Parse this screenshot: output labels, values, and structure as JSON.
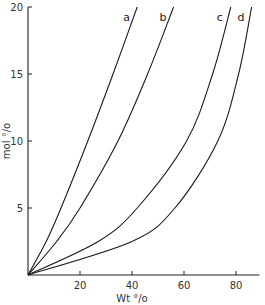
{
  "chart_data": {
    "type": "line",
    "title": "",
    "xlabel": "Wt °/o",
    "ylabel": "mol °/o",
    "xlim": [
      0,
      89
    ],
    "ylim": [
      0,
      20
    ],
    "xticks": [
      20,
      40,
      60,
      80
    ],
    "yticks": [
      5,
      10,
      15,
      20
    ],
    "grid": false,
    "legend": "curve labels at top ends",
    "series": [
      {
        "name": "a",
        "x": [
          0,
          7,
          12.7,
          23,
          32.7,
          42
        ],
        "y": [
          0,
          2.5,
          5,
          10,
          15,
          20
        ]
      },
      {
        "name": "b",
        "x": [
          0,
          11,
          20,
          34.6,
          46,
          56
        ],
        "y": [
          0,
          2.5,
          5,
          10,
          15,
          20
        ]
      },
      {
        "name": "c",
        "x": [
          0,
          27,
          42,
          61,
          71,
          78
        ],
        "y": [
          0,
          2.5,
          5,
          10,
          15,
          20
        ]
      },
      {
        "name": "d",
        "x": [
          0,
          40,
          56.5,
          73,
          81,
          86
        ],
        "y": [
          0,
          2.5,
          5,
          10,
          15,
          20
        ]
      }
    ]
  }
}
